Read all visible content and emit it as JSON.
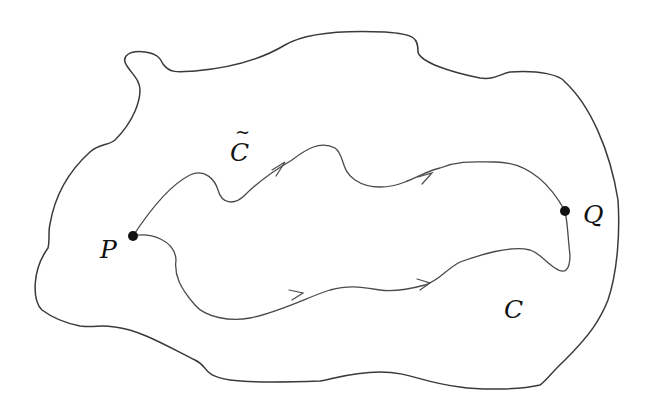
{
  "diagram": {
    "type": "region-with-two-paths",
    "labels": {
      "p": "P",
      "q": "Q",
      "c": "C",
      "c_tilde": "C",
      "tilde": "~"
    },
    "points": [
      {
        "name": "P",
        "x": 133,
        "y": 236
      },
      {
        "name": "Q",
        "x": 565,
        "y": 211
      }
    ],
    "paths": [
      {
        "name": "C-tilde",
        "from": "P",
        "to": "Q",
        "position": "upper",
        "arrows": 2
      },
      {
        "name": "C",
        "from": "P",
        "to": "Q",
        "position": "lower",
        "arrows": 2
      }
    ],
    "colors": {
      "stroke": "#4a4a4a",
      "point": "#111111",
      "background": "#ffffff"
    }
  }
}
